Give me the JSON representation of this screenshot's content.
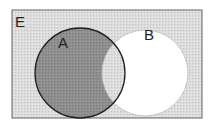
{
  "diagram": {
    "type": "venn",
    "universe_label": "E",
    "sets": [
      {
        "label": "A",
        "shaded": "A only (A minus B)"
      },
      {
        "label": "B",
        "shaded": "none outside A"
      }
    ],
    "shaded_region": "complement of B (A\\B dark, outside both light)",
    "colors": {
      "universe_fill": "#d9d9d9",
      "a_only_fill": "#8a8a8a",
      "intersection_fill": "#d4d4d4",
      "b_only_fill": "#ffffff",
      "outline": "#333333"
    }
  }
}
